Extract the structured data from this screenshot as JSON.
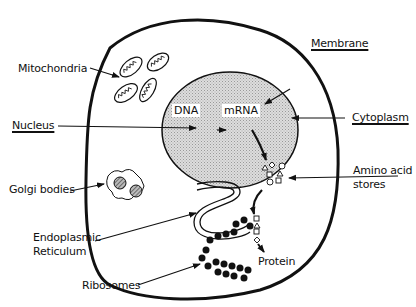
{
  "diagram": {
    "labels": {
      "membrane": "Membrane",
      "cytoplasm": "Cytoplasm",
      "mitochondria": "Mitochondria",
      "nucleus": "Nucleus",
      "golgi": "Golgi bodies",
      "er_line1": "Endoplasmic",
      "er_line2": "Reticulum",
      "ribosomes": "Ribosomes",
      "amino_line1": "Amino acid",
      "amino_line2": "stores",
      "protein": "Protein",
      "dna": "DNA",
      "mrna": "mRNA"
    },
    "flow": [
      "DNA",
      "mRNA",
      "Amino acid stores",
      "Protein"
    ]
  }
}
